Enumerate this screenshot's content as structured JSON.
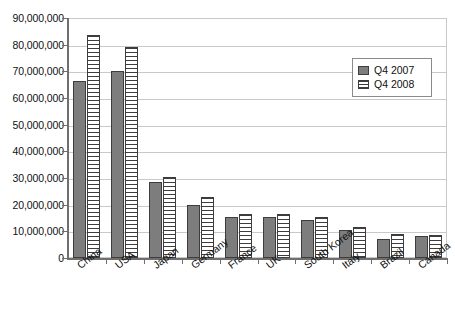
{
  "chart_data": {
    "type": "bar",
    "title": "",
    "xlabel": "",
    "ylabel": "",
    "ylim": [
      0,
      90000000
    ],
    "ytick_step": 10000000,
    "grid": true,
    "legend_position": "upper-right",
    "categories": [
      "China",
      "USA",
      "Japan",
      "Germany",
      "France",
      "UK",
      "South Korea",
      "Italy",
      "Brazil",
      "Canada"
    ],
    "ytick_labels": [
      "90,000,000",
      "80,000,000",
      "70,000,000",
      "60,000,000",
      "50,000,000",
      "40,000,000",
      "30,000,000",
      "20,000,000",
      "10,000,000",
      "0"
    ],
    "ytick_values": [
      90000000,
      80000000,
      70000000,
      60000000,
      50000000,
      40000000,
      30000000,
      20000000,
      10000000,
      0
    ],
    "series": [
      {
        "name": "Q4 2007",
        "fill": "solid-gray",
        "color": "#7d7d7d",
        "values": [
          66500000,
          70000000,
          28500000,
          19800000,
          15200000,
          15300000,
          14300000,
          10600000,
          7200000,
          8200000
        ]
      },
      {
        "name": "Q4 2008",
        "fill": "horizontal-stripes",
        "color": "#ffffff",
        "values": [
          83500000,
          79000000,
          30500000,
          23000000,
          16500000,
          16500000,
          15200000,
          11800000,
          9000000,
          8800000
        ]
      }
    ]
  },
  "legend": {
    "items": [
      {
        "label": "Q4 2007"
      },
      {
        "label": "Q4 2008"
      }
    ]
  },
  "colors": {
    "series_2007": "#7d7d7d",
    "series_2008": "#ffffff",
    "bar_outline": "#3d3d3d",
    "gridline": "#c9c9c9",
    "axis": "#6f6f6f",
    "background": "#ffffff"
  }
}
